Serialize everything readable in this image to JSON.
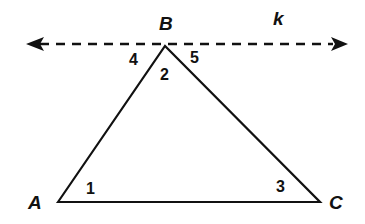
{
  "diagram": {
    "type": "geometry",
    "line": {
      "label": "k",
      "style": "dashed",
      "arrows": "both"
    },
    "vertices": [
      {
        "label": "A"
      },
      {
        "label": "B"
      },
      {
        "label": "C"
      }
    ],
    "angles": [
      {
        "label": "1",
        "at": "A"
      },
      {
        "label": "2",
        "at": "B"
      },
      {
        "label": "3",
        "at": "C"
      },
      {
        "label": "4",
        "at": "B-left"
      },
      {
        "label": "5",
        "at": "B-right"
      }
    ],
    "colors": {
      "stroke": "#111111",
      "background": "#ffffff"
    }
  }
}
